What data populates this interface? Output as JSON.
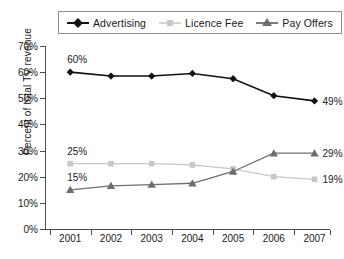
{
  "chart_data": {
    "type": "line",
    "title": "",
    "xlabel": "",
    "ylabel": "Percent of total TV revenue",
    "categories": [
      "2001",
      "2002",
      "2003",
      "2004",
      "2005",
      "2006",
      "2007"
    ],
    "ylim": [
      0,
      70
    ],
    "ytick_labels": [
      "0%",
      "10%",
      "20%",
      "30%",
      "40%",
      "50%",
      "60%",
      "70%"
    ],
    "ytick_values": [
      0,
      10,
      20,
      30,
      40,
      50,
      60,
      70
    ],
    "grid": false,
    "legend_position": "top",
    "series": [
      {
        "name": "Advertising",
        "color": "#111111",
        "marker": "diamond",
        "values": [
          60,
          58.5,
          58.5,
          59.5,
          57.5,
          51,
          49
        ],
        "end_labels": {
          "first": "60%",
          "last": "49%"
        }
      },
      {
        "name": "Licence Fee",
        "color": "#c8c8c8",
        "marker": "square",
        "values": [
          25,
          25,
          25,
          24.5,
          23,
          20,
          19
        ],
        "end_labels": {
          "first": "25%",
          "last": "19%"
        }
      },
      {
        "name": "Pay Offers",
        "color": "#6e6e6e",
        "marker": "triangle",
        "values": [
          15,
          16.5,
          17,
          17.5,
          22,
          29,
          29
        ],
        "end_labels": {
          "first": "15%",
          "last": "29%"
        }
      }
    ],
    "annotations": [
      {
        "text": "60%",
        "series": "Advertising",
        "position": "above-first"
      },
      {
        "text": "49%",
        "series": "Advertising",
        "position": "right-last"
      },
      {
        "text": "25%",
        "series": "Licence Fee",
        "position": "above-first"
      },
      {
        "text": "19%",
        "series": "Licence Fee",
        "position": "right-last"
      },
      {
        "text": "15%",
        "series": "Pay Offers",
        "position": "above-first"
      },
      {
        "text": "29%",
        "series": "Pay Offers",
        "position": "right-last"
      }
    ]
  },
  "legend": {
    "items": [
      {
        "label": "Advertising"
      },
      {
        "label": "Licence Fee"
      },
      {
        "label": "Pay Offers"
      }
    ]
  }
}
